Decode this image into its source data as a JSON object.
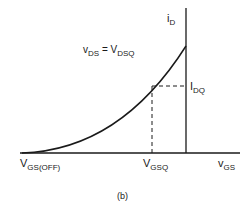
{
  "diagram": {
    "type": "transfer-characteristic",
    "caption": "(b)",
    "axes": {
      "x": {
        "symbol": "v",
        "subscript": "GS"
      },
      "y": {
        "symbol": "i",
        "subscript": "D"
      }
    },
    "curve_label": {
      "lhs_symbol": "v",
      "lhs_subscript": "DS",
      "equals": "=",
      "rhs_symbol": "V",
      "rhs_subscript": "DSQ"
    },
    "points": {
      "cutoff": {
        "symbol": "V",
        "subscript": "GS(OFF)"
      },
      "q_vgs": {
        "symbol": "V",
        "subscript": "GSQ"
      },
      "q_id": {
        "symbol": "I",
        "subscript": "DQ"
      }
    },
    "colors": {
      "line": "#1a1a1a",
      "background": "#ffffff"
    }
  }
}
